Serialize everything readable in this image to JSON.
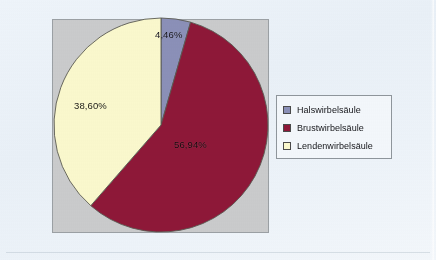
{
  "chart_data": {
    "type": "pie",
    "title": "",
    "subtitle": "",
    "xlabel": "",
    "ylabel": "",
    "grid": false,
    "legend_position": "right",
    "start_angle_deg": 0,
    "direction": "clockwise",
    "categories": [
      "Halswirbelsäule",
      "Brustwirbelsäule",
      "Lendenwirbelsäule"
    ],
    "values": [
      4.46,
      56.94,
      38.6
    ],
    "value_unit": "%",
    "data_labels": [
      "4,46%",
      "56,94%",
      "38,60%"
    ],
    "colors": [
      "#8b90b8",
      "#8e1838",
      "#faf8cd"
    ],
    "slices": [
      {
        "label": "Halswirbelsäule",
        "value": 4.46,
        "display": "4,46%",
        "color": "#8b90b8"
      },
      {
        "label": "Brustwirbelsäule",
        "value": 56.94,
        "display": "56,94%",
        "color": "#8e1838"
      },
      {
        "label": "Lendenwirbelsäule",
        "value": 38.6,
        "display": "38,60%",
        "color": "#faf8cd"
      }
    ]
  },
  "plot": {
    "background_color": "#cacbcc",
    "border_color": "#9ba0a4"
  },
  "legend": {
    "items": [
      {
        "label": "Halswirbelsäule",
        "color": "#8b90b8"
      },
      {
        "label": "Brustwirbelsäule",
        "color": "#8e1838"
      },
      {
        "label": "Lendenwirbelsäule",
        "color": "#faf8cd"
      }
    ]
  }
}
